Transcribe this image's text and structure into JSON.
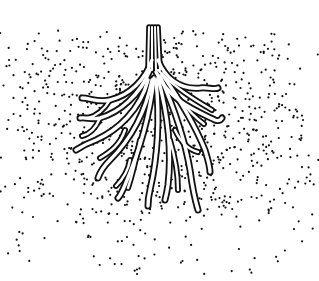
{
  "image": {
    "subject": "roots-in-soil-illustration",
    "width": 319,
    "height": 281,
    "background_color": "#ffffff",
    "ink_color": "#111111",
    "root_fill_color": "#ffffff"
  },
  "roots": {
    "main_stem": "M152 27 L152 70 M155 27 L156 70 M158 27 L160 70 M149 27 L148 70",
    "branches": [
      "M152 60 C145 80 130 95 110 100 C98 103 90 98 82 98",
      "M158 60 C165 78 180 90 200 88 C208 87 214 90 218 88",
      "M150 70 C140 95 120 112 100 118 C92 120 86 117 80 118",
      "M156 72 C170 100 190 108 215 120 C220 122 222 118 222 118",
      "M148 80 C140 110 118 130 96 140 C88 143 82 146 76 150",
      "M152 80 C145 115 130 140 110 160 C104 166 100 172 98 178",
      "M154 78 C150 115 140 150 125 185 C122 192 120 196 118 198",
      "M156 80 C160 120 158 155 150 190 C148 198 148 202 148 206",
      "M158 78 C168 115 172 150 168 185 C167 192 166 196 165 200",
      "M160 76 C175 110 185 140 190 170 C192 185 195 200 198 210",
      "M162 74 C180 100 195 125 205 150 C208 160 210 166 210 172",
      "M158 70 C175 88 195 100 212 110",
      "M110 100 C104 110 96 116 88 118",
      "M100 118 C96 128 90 134 82 136",
      "M125 130 C120 145 110 152 100 158",
      "M130 160 C128 172 122 180 116 186",
      "M175 130 C182 145 190 150 198 152",
      "M180 100 C188 110 196 118 204 124",
      "M140 140 C136 160 132 176 128 188",
      "M170 140 C176 160 178 176 178 190"
    ]
  },
  "soil": {
    "dot_count": 900,
    "dot_radius": 1.1,
    "region": {
      "x": 0,
      "y": 30,
      "width": 319,
      "height": 245
    }
  }
}
